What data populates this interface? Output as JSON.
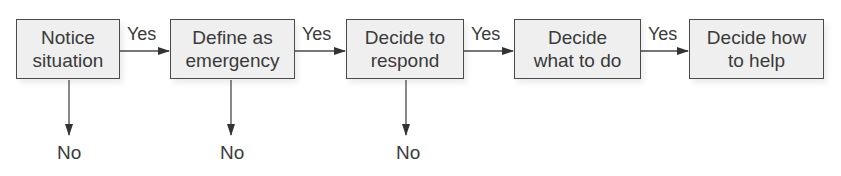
{
  "diagram": {
    "type": "flowchart",
    "direction": "left-to-right",
    "steps": [
      {
        "id": "notice",
        "line1": "Notice",
        "line2": "situation"
      },
      {
        "id": "define",
        "line1": "Define as",
        "line2": "emergency"
      },
      {
        "id": "respond",
        "line1": "Decide to",
        "line2": "respond"
      },
      {
        "id": "what",
        "line1": "Decide",
        "line2": "what to do"
      },
      {
        "id": "how",
        "line1": "Decide how",
        "line2": "to help"
      }
    ],
    "yes_labels": [
      "Yes",
      "Yes",
      "Yes",
      "Yes"
    ],
    "no_labels": [
      "No",
      "No",
      "No"
    ],
    "edges": [
      {
        "from": "notice",
        "to": "define",
        "label": "Yes"
      },
      {
        "from": "define",
        "to": "respond",
        "label": "Yes"
      },
      {
        "from": "respond",
        "to": "what",
        "label": "Yes"
      },
      {
        "from": "what",
        "to": "how",
        "label": "Yes"
      },
      {
        "from": "notice",
        "to": "no-1",
        "label": "No"
      },
      {
        "from": "define",
        "to": "no-2",
        "label": "No"
      },
      {
        "from": "respond",
        "to": "no-3",
        "label": "No"
      }
    ],
    "colors": {
      "box_fill": "#efefef",
      "stroke": "#4a4a4a",
      "text": "#3a3a3a"
    }
  }
}
